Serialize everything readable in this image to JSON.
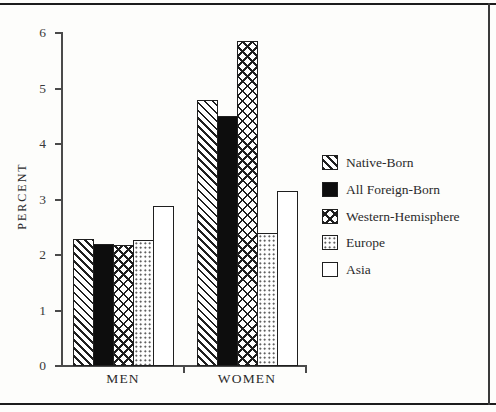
{
  "figure": {
    "background": "#fdfdfb",
    "frame_color": "#1c1c1c"
  },
  "chart_data": {
    "type": "bar",
    "title": "",
    "xlabel": "",
    "ylabel": "PERCENT",
    "ylim": [
      0,
      6
    ],
    "yticks": [
      0,
      1,
      2,
      3,
      4,
      5,
      6
    ],
    "grid": false,
    "legend_position": "right",
    "categories": [
      "MEN",
      "WOMEN"
    ],
    "series": [
      {
        "name": "Native-Born",
        "pattern": "diagonal",
        "values": [
          2.28,
          4.8
        ]
      },
      {
        "name": "All Foreign-Born",
        "pattern": "solid",
        "values": [
          2.2,
          4.5
        ]
      },
      {
        "name": "Western-Hemisphere",
        "pattern": "crosshatch",
        "values": [
          2.18,
          5.85
        ]
      },
      {
        "name": "Europe",
        "pattern": "dots",
        "values": [
          2.27,
          2.4
        ]
      },
      {
        "name": "Asia",
        "pattern": "plain",
        "values": [
          2.88,
          3.15
        ]
      }
    ]
  }
}
